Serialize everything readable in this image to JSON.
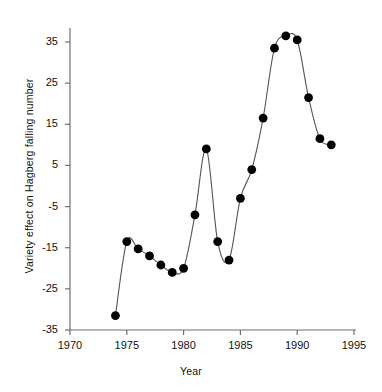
{
  "chart_data": {
    "type": "line",
    "title": "",
    "subtitle": "",
    "xlabel": "Year",
    "ylabel": "Variety effect on Hagberg falling number",
    "xlim": [
      1970,
      1995
    ],
    "ylim": [
      -35,
      39
    ],
    "xticks": [
      1970,
      1975,
      1980,
      1985,
      1990,
      1995
    ],
    "xtick_labels": [
      "1970",
      "1975",
      "1980",
      "1985",
      "1990",
      "1995"
    ],
    "yticks": [
      35,
      25,
      15,
      5,
      -5,
      -15,
      -25,
      -35
    ],
    "ytick_labels": [
      "35",
      "25",
      "15",
      "5",
      "-5",
      "-15",
      "-25",
      "-35"
    ],
    "grid": false,
    "legend": null,
    "marker": "filled-circle",
    "marker_color": "#000000",
    "line_color": "#555555",
    "x": [
      1974,
      1975,
      1976,
      1977,
      1978,
      1979,
      1980,
      1981,
      1982,
      1983,
      1984,
      1985,
      1986,
      1987,
      1988,
      1989,
      1990,
      1991,
      1992,
      1993
    ],
    "values": [
      -31.5,
      -13.5,
      -15.3,
      -17.0,
      -19.2,
      -21.0,
      -20.0,
      -7.0,
      9.0,
      -13.5,
      -18.0,
      -3.0,
      4.0,
      16.5,
      33.5,
      36.5,
      35.5,
      21.5,
      11.5,
      10.0
    ],
    "series": [
      {
        "name": "Variety effect on Hagberg falling number",
        "x": [
          1974,
          1975,
          1976,
          1977,
          1978,
          1979,
          1980,
          1981,
          1982,
          1983,
          1984,
          1985,
          1986,
          1987,
          1988,
          1989,
          1990,
          1991,
          1992,
          1993
        ],
        "values": [
          -31.5,
          -13.5,
          -15.3,
          -17.0,
          -19.2,
          -21.0,
          -20.0,
          -7.0,
          9.0,
          -13.5,
          -18.0,
          -3.0,
          4.0,
          16.5,
          33.5,
          36.5,
          35.5,
          21.5,
          11.5,
          10.0
        ]
      }
    ]
  },
  "axes": {
    "x_label": "Year",
    "y_label": "Variety effect on Hagberg falling number"
  }
}
